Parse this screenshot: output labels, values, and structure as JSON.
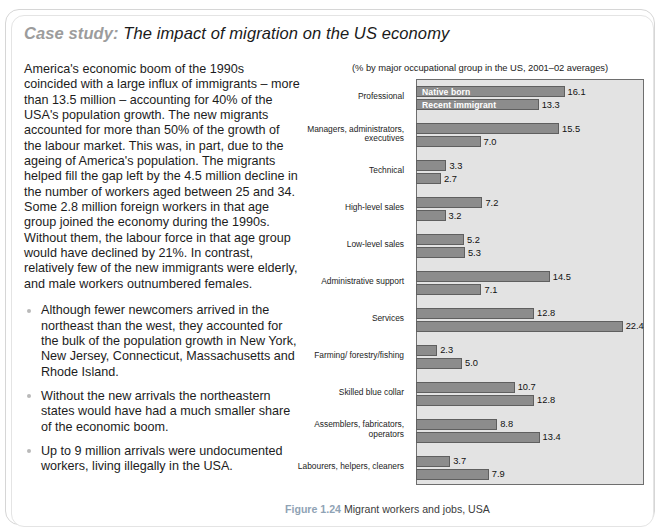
{
  "heading": {
    "label": "Case study:",
    "title": "The impact of migration on the US economy"
  },
  "body": {
    "intro": "America's economic boom of the 1990s coincided with a large influx of immigrants – more than 13.5 million – accounting for 40% of the USA's population growth. The new migrants accounted for more than 50% of the growth of the labour market. This was, in part, due to the ageing of America's population. The migrants helped fill the gap left by the 4.5 million decline in the number of workers aged between 25 and 34. Some 2.8 million foreign workers in that age group joined the economy during the 1990s. Without them, the labour force in that age group would have declined by 21%. In contrast, relatively few of the new immigrants were elderly, and male workers outnumbered females.",
    "bullets": [
      "Although fewer newcomers arrived in the northeast than the west, they accounted for the bulk of the population growth in New York, New Jersey, Connecticut, Massachusetts and Rhode Island.",
      "Without the new arrivals the northeastern states would have had a much smaller share of the economic boom.",
      "Up to 9 million arrivals were undocumented workers, living illegally in the USA."
    ]
  },
  "figure": {
    "number": "Figure 1.24",
    "caption": "Migrant workers and jobs, USA"
  },
  "chart_data": {
    "type": "bar",
    "orientation": "horizontal",
    "title": "",
    "subtitle": "(% by major occupational group in the US, 2001–02 averages)",
    "xlabel": "",
    "ylabel": "",
    "xlim": [
      0,
      24.5
    ],
    "grid": false,
    "legend_position": "overlay-first-bars",
    "categories": [
      "Professional",
      "Managers, administrators, executives",
      "Technical",
      "High-level sales",
      "Low-level sales",
      "Administrative support",
      "Services",
      "Farming/ forestry/fishing",
      "Skilled blue collar",
      "Assemblers, fabricators, operators",
      "Labourers, helpers, cleaners"
    ],
    "series": [
      {
        "name": "Native born",
        "values": [
          16.1,
          15.5,
          3.3,
          7.2,
          5.2,
          14.5,
          12.8,
          2.3,
          10.7,
          8.8,
          3.7
        ]
      },
      {
        "name": "Recent immigrant",
        "values": [
          13.3,
          7.0,
          2.7,
          3.2,
          5.3,
          7.1,
          22.4,
          5.0,
          12.8,
          13.4,
          7.9
        ]
      }
    ],
    "colors": {
      "bar_fill": "#8c8c8c",
      "bar_stroke": "#5f5f5f",
      "plot_background": "#e3e3e3",
      "plot_border": "#6e6e6e",
      "legend_text": "#ffffff",
      "figure_number": "#8fa3b5"
    }
  }
}
